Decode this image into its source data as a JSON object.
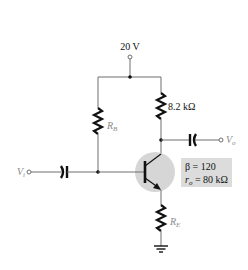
{
  "diagram": {
    "type": "common-emitter BJT amplifier (emitter-bias)",
    "supply": {
      "label": "20 V"
    },
    "components": {
      "rb": {
        "symbol": "R",
        "sub": "B"
      },
      "rc": {
        "label": "8.2 kΩ"
      },
      "re": {
        "symbol": "R",
        "sub": "E"
      },
      "input": {
        "symbol": "V",
        "sub": "i"
      },
      "output": {
        "symbol": "V",
        "sub": "o"
      }
    },
    "transistor_params": {
      "beta_line": "β = 120",
      "ro_symbol": "r",
      "ro_sub": "o",
      "ro_value": " = 80 kΩ"
    },
    "colors": {
      "wire": "#6e6e6e",
      "component": "#111111",
      "transistor_highlight": "#d6d6d6",
      "param_box": "#dcdcdc"
    }
  }
}
